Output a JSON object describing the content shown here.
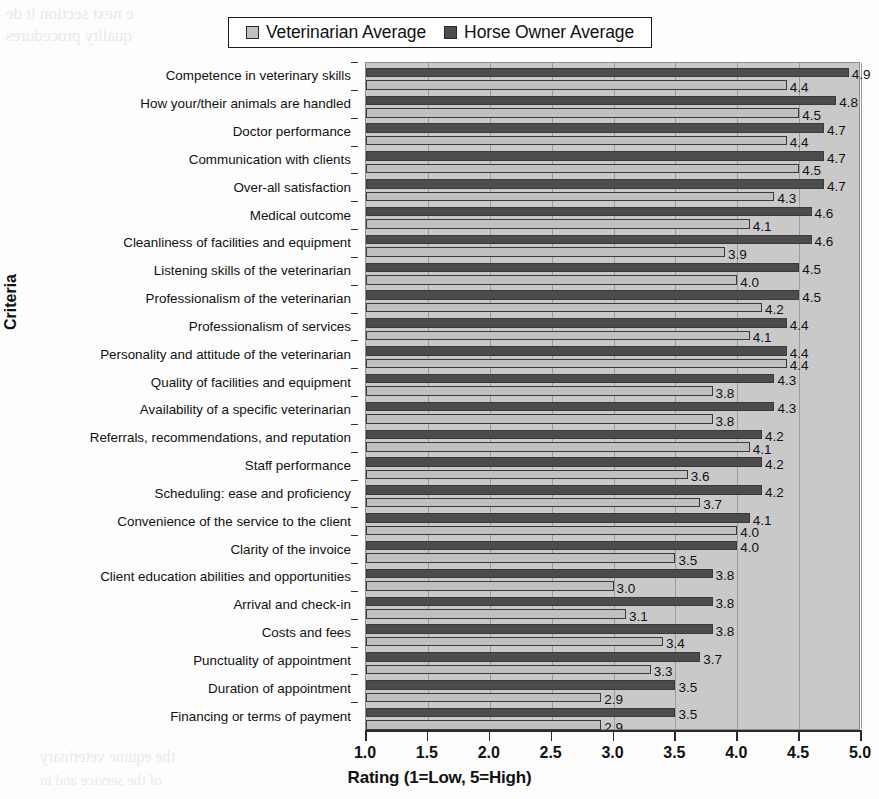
{
  "chart_data": {
    "type": "bar",
    "orientation": "horizontal",
    "title": "",
    "xlabel": "Rating (1=Low, 5=High)",
    "ylabel": "Criteria",
    "xlim": [
      1.0,
      5.0
    ],
    "xticks": [
      "1.0",
      "1.5",
      "2.0",
      "2.5",
      "3.0",
      "3.5",
      "4.0",
      "4.5",
      "5.0"
    ],
    "grid": true,
    "legend_position": "top-center",
    "categories": [
      "Competence in veterinary skills",
      "How your/their animals are handled",
      "Doctor performance",
      "Communication with clients",
      "Over-all satisfaction",
      "Medical outcome",
      "Cleanliness of facilities and equipment",
      "Listening skills of the veterinarian",
      "Professionalism of the veterinarian",
      "Professionalism of services",
      "Personality and attitude of the veterinarian",
      "Quality of facilities and equipment",
      "Availability of a specific veterinarian",
      "Referrals, recommendations, and reputation",
      "Staff performance",
      "Scheduling: ease and proficiency",
      "Convenience of the service to the client",
      "Clarity of the invoice",
      "Client education abilities and opportunities",
      "Arrival and check-in",
      "Costs and fees",
      "Punctuality of appointment",
      "Duration of appointment",
      "Financing or terms of payment"
    ],
    "series": [
      {
        "name": "Horse Owner Average",
        "color": "#4c4c4c",
        "values": [
          4.9,
          4.8,
          4.7,
          4.7,
          4.7,
          4.6,
          4.6,
          4.5,
          4.5,
          4.4,
          4.4,
          4.3,
          4.3,
          4.2,
          4.2,
          4.2,
          4.1,
          4.0,
          3.8,
          3.8,
          3.8,
          3.7,
          3.5,
          3.5
        ],
        "labels": [
          "4.9",
          "4.8",
          "4.7",
          "4.7",
          "4.7",
          "4.6",
          "4.6",
          "4.5",
          "4.5",
          "4.4",
          "4.4",
          "4.3",
          "4.3",
          "4.2",
          "4.2",
          "4.2",
          "4.1",
          "4.0",
          "3.8",
          "3.8",
          "3.8",
          "3.7",
          "3.5",
          "3.5"
        ]
      },
      {
        "name": "Veterinarian Average",
        "color": "#c0c0c0",
        "values": [
          4.4,
          4.5,
          4.4,
          4.5,
          4.3,
          4.1,
          3.9,
          4.0,
          4.2,
          4.1,
          4.4,
          3.8,
          3.8,
          4.1,
          3.6,
          3.7,
          4.0,
          3.5,
          3.0,
          3.1,
          3.4,
          3.3,
          2.9,
          2.9
        ],
        "labels": [
          "4.4",
          "4.5",
          "4.4",
          "4.5",
          "4.3",
          "4.1",
          "3.9",
          "4.0",
          "4.2",
          "4.1",
          "4.4",
          "3.8",
          "3.8",
          "4.1",
          "3.6",
          "3.7",
          "4.0",
          "3.5",
          "3.0",
          "3.1",
          "3.4",
          "3.3",
          "2.9",
          "2.9"
        ]
      }
    ]
  },
  "legend": {
    "entries": [
      {
        "label": "Veterinarian Average",
        "color": "#c0c0c0"
      },
      {
        "label": "Horse Owner Average",
        "color": "#4c4c4c"
      }
    ]
  },
  "axes": {
    "x_title": "Rating (1=Low, 5=High)",
    "y_title": "Criteria"
  },
  "scan_artifacts": {
    "top_line_1": "e next section it de",
    "top_line_2": "quality procedures",
    "bottom_line_1": "the equine veterinary",
    "bottom_line_2": "of the service and in"
  }
}
